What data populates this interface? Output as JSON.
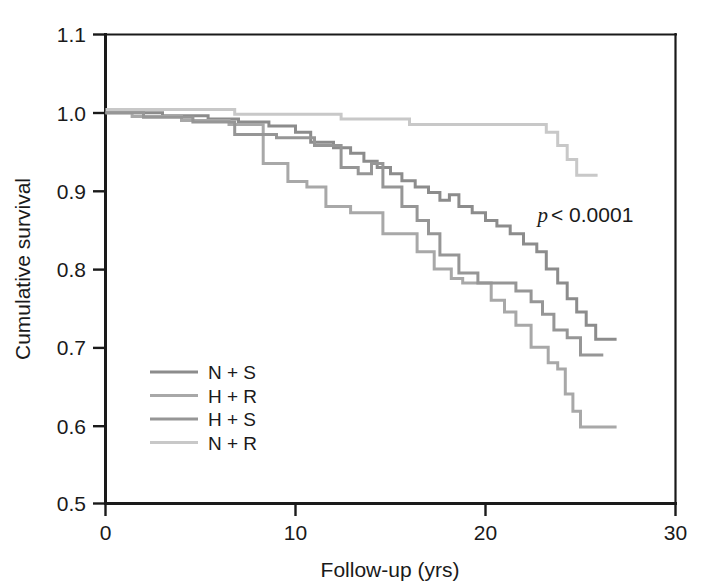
{
  "chart_data": {
    "type": "line",
    "subtype": "kaplan-meier-step",
    "title": "",
    "xlabel": "Follow-up (yrs)",
    "ylabel": "Cumulative survival",
    "xlim": [
      0,
      30
    ],
    "ylim": [
      0.5,
      1.1
    ],
    "xticks": [
      0,
      10,
      20,
      30
    ],
    "yticks": [
      0.5,
      0.6,
      0.7,
      0.8,
      0.9,
      1.0,
      1.1
    ],
    "xtick_labels": [
      "0",
      "10",
      "20",
      "30"
    ],
    "ytick_labels": [
      "0.5",
      "0.6",
      "0.7",
      "0.8",
      "0.9",
      "1.0",
      "1.1"
    ],
    "grid": false,
    "legend_position": "lower-left-inside",
    "annotations": [
      {
        "name": "p-value",
        "italic_part": "p",
        "text_part": " < 0.0001",
        "full_text": "p < 0.0001",
        "x": 19.0,
        "y": 0.855
      }
    ],
    "series": [
      {
        "name": "N + S",
        "color": "#8c8c8c",
        "final_value": 0.71,
        "points": [
          [
            0.0,
            1.0
          ],
          [
            3.0,
            1.0
          ],
          [
            3.0,
            0.996
          ],
          [
            5.4,
            0.996
          ],
          [
            5.4,
            0.992
          ],
          [
            7.0,
            0.992
          ],
          [
            7.0,
            0.988
          ],
          [
            8.6,
            0.988
          ],
          [
            8.6,
            0.983
          ],
          [
            10.0,
            0.983
          ],
          [
            10.0,
            0.975
          ],
          [
            10.8,
            0.975
          ],
          [
            10.8,
            0.962
          ],
          [
            12.0,
            0.962
          ],
          [
            12.0,
            0.955
          ],
          [
            12.9,
            0.955
          ],
          [
            12.9,
            0.948
          ],
          [
            13.6,
            0.948
          ],
          [
            13.6,
            0.938
          ],
          [
            14.3,
            0.938
          ],
          [
            14.3,
            0.93
          ],
          [
            15.0,
            0.93
          ],
          [
            15.0,
            0.922
          ],
          [
            15.6,
            0.922
          ],
          [
            15.6,
            0.913
          ],
          [
            16.3,
            0.913
          ],
          [
            16.3,
            0.905
          ],
          [
            17.0,
            0.905
          ],
          [
            17.0,
            0.898
          ],
          [
            17.6,
            0.898
          ],
          [
            17.6,
            0.888
          ],
          [
            18.1,
            0.888
          ],
          [
            18.1,
            0.895
          ],
          [
            18.6,
            0.895
          ],
          [
            18.6,
            0.88
          ],
          [
            19.3,
            0.88
          ],
          [
            19.3,
            0.872
          ],
          [
            20.0,
            0.872
          ],
          [
            20.0,
            0.862
          ],
          [
            20.6,
            0.862
          ],
          [
            20.6,
            0.855
          ],
          [
            21.3,
            0.855
          ],
          [
            21.3,
            0.845
          ],
          [
            22.0,
            0.845
          ],
          [
            22.0,
            0.832
          ],
          [
            22.7,
            0.832
          ],
          [
            22.7,
            0.822
          ],
          [
            23.2,
            0.822
          ],
          [
            23.2,
            0.8
          ],
          [
            23.8,
            0.8
          ],
          [
            23.8,
            0.782
          ],
          [
            24.3,
            0.782
          ],
          [
            24.3,
            0.762
          ],
          [
            24.8,
            0.762
          ],
          [
            24.8,
            0.745
          ],
          [
            25.3,
            0.745
          ],
          [
            25.3,
            0.728
          ],
          [
            25.8,
            0.728
          ],
          [
            25.8,
            0.71
          ],
          [
            26.9,
            0.71
          ]
        ]
      },
      {
        "name": "H + R",
        "color": "#a8a8a8",
        "final_value": 0.6,
        "points": [
          [
            0.0,
            1.0
          ],
          [
            1.4,
            1.0
          ],
          [
            1.4,
            0.995
          ],
          [
            4.0,
            0.995
          ],
          [
            4.0,
            0.99
          ],
          [
            6.5,
            0.99
          ],
          [
            6.5,
            0.985
          ],
          [
            8.3,
            0.985
          ],
          [
            8.3,
            0.935
          ],
          [
            9.6,
            0.935
          ],
          [
            9.6,
            0.912
          ],
          [
            10.6,
            0.912
          ],
          [
            10.6,
            0.905
          ],
          [
            11.6,
            0.905
          ],
          [
            11.6,
            0.88
          ],
          [
            12.9,
            0.88
          ],
          [
            12.9,
            0.872
          ],
          [
            14.6,
            0.872
          ],
          [
            14.6,
            0.845
          ],
          [
            16.4,
            0.845
          ],
          [
            16.4,
            0.822
          ],
          [
            17.3,
            0.822
          ],
          [
            17.3,
            0.8
          ],
          [
            18.2,
            0.8
          ],
          [
            18.2,
            0.788
          ],
          [
            18.8,
            0.788
          ],
          [
            18.8,
            0.782
          ],
          [
            20.3,
            0.782
          ],
          [
            20.3,
            0.76
          ],
          [
            21.0,
            0.76
          ],
          [
            21.0,
            0.745
          ],
          [
            21.6,
            0.745
          ],
          [
            21.6,
            0.728
          ],
          [
            22.4,
            0.728
          ],
          [
            22.4,
            0.7
          ],
          [
            23.3,
            0.7
          ],
          [
            23.3,
            0.68
          ],
          [
            23.8,
            0.68
          ],
          [
            23.8,
            0.672
          ],
          [
            24.2,
            0.672
          ],
          [
            24.2,
            0.64
          ],
          [
            24.6,
            0.64
          ],
          [
            24.6,
            0.618
          ],
          [
            25.0,
            0.618
          ],
          [
            25.0,
            0.598
          ],
          [
            26.9,
            0.598
          ]
        ]
      },
      {
        "name": "H + S",
        "color": "#969696",
        "final_value": 0.69,
        "points": [
          [
            0.0,
            1.0
          ],
          [
            2.0,
            1.0
          ],
          [
            2.0,
            0.994
          ],
          [
            4.6,
            0.994
          ],
          [
            4.6,
            0.988
          ],
          [
            6.8,
            0.988
          ],
          [
            6.8,
            0.972
          ],
          [
            9.0,
            0.972
          ],
          [
            9.0,
            0.968
          ],
          [
            11.0,
            0.968
          ],
          [
            11.0,
            0.958
          ],
          [
            12.4,
            0.958
          ],
          [
            12.4,
            0.93
          ],
          [
            13.3,
            0.93
          ],
          [
            13.3,
            0.922
          ],
          [
            14.0,
            0.922
          ],
          [
            14.0,
            0.935
          ],
          [
            14.6,
            0.935
          ],
          [
            14.6,
            0.905
          ],
          [
            15.6,
            0.905
          ],
          [
            15.6,
            0.88
          ],
          [
            16.4,
            0.88
          ],
          [
            16.4,
            0.862
          ],
          [
            17.0,
            0.862
          ],
          [
            17.0,
            0.845
          ],
          [
            17.6,
            0.845
          ],
          [
            17.6,
            0.818
          ],
          [
            18.6,
            0.818
          ],
          [
            18.6,
            0.795
          ],
          [
            19.6,
            0.795
          ],
          [
            19.6,
            0.782
          ],
          [
            21.6,
            0.782
          ],
          [
            21.6,
            0.772
          ],
          [
            22.4,
            0.772
          ],
          [
            22.4,
            0.758
          ],
          [
            23.0,
            0.758
          ],
          [
            23.0,
            0.742
          ],
          [
            23.6,
            0.742
          ],
          [
            23.6,
            0.722
          ],
          [
            24.3,
            0.722
          ],
          [
            24.3,
            0.712
          ],
          [
            25.0,
            0.712
          ],
          [
            25.0,
            0.69
          ],
          [
            26.2,
            0.69
          ]
        ]
      },
      {
        "name": "N + R",
        "color": "#c8c8c8",
        "final_value": 0.92,
        "points": [
          [
            0.0,
            1.004
          ],
          [
            6.8,
            1.004
          ],
          [
            6.8,
            0.998
          ],
          [
            12.4,
            0.998
          ],
          [
            12.4,
            0.992
          ],
          [
            16.0,
            0.992
          ],
          [
            16.0,
            0.985
          ],
          [
            23.2,
            0.985
          ],
          [
            23.2,
            0.975
          ],
          [
            23.8,
            0.975
          ],
          [
            23.8,
            0.958
          ],
          [
            24.3,
            0.958
          ],
          [
            24.3,
            0.94
          ],
          [
            24.8,
            0.94
          ],
          [
            24.8,
            0.92
          ],
          [
            25.9,
            0.92
          ]
        ]
      }
    ]
  },
  "axes": {
    "y_title": "Cumulative survival",
    "x_title": "Follow-up (yrs)",
    "y_tick_labels": [
      "1.1",
      "1.0",
      "0.9",
      "0.8",
      "0.7",
      "0.6",
      "0.5"
    ],
    "x_tick_labels": [
      "0",
      "10",
      "20",
      "30"
    ]
  },
  "legend": {
    "items": [
      {
        "label": "N + S",
        "color": "#8c8c8c"
      },
      {
        "label": "H + R",
        "color": "#a8a8a8"
      },
      {
        "label": "H + S",
        "color": "#969696"
      },
      {
        "label": "N + R",
        "color": "#c8c8c8"
      }
    ]
  },
  "annotation": {
    "p_symbol": "p",
    "p_text": " < 0.0001"
  },
  "style": {
    "axis_color": "#1a1a1a",
    "background": "#ffffff"
  }
}
